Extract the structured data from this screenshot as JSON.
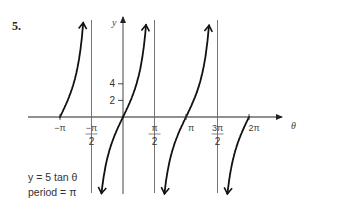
{
  "problem_number": "5.",
  "chart_data": {
    "type": "line",
    "title": "",
    "function": "y = 5 tan θ",
    "series": [
      {
        "name": "y = 5 tan θ",
        "branch": 1,
        "x_domain": [
          "-π",
          "-π/2"
        ],
        "x": [
          -3.1416,
          -2.8,
          -2.4,
          -2.0,
          -1.75,
          -1.65
        ],
        "y": [
          0,
          1.72,
          4.58,
          10.93,
          27.3,
          64.0
        ]
      },
      {
        "name": "y = 5 tan θ",
        "branch": 2,
        "x_domain": [
          "-π/2",
          "π/2"
        ],
        "x": [
          -1.48,
          -1.2,
          -0.8,
          -0.4,
          0,
          0.4,
          0.8,
          1.2,
          1.48
        ],
        "y": [
          -54.4,
          -12.86,
          -5.15,
          -2.11,
          0,
          2.11,
          5.15,
          12.86,
          54.4
        ]
      },
      {
        "name": "y = 5 tan θ",
        "branch": 3,
        "x_domain": [
          "π/2",
          "3π/2"
        ],
        "x": [
          1.66,
          2.0,
          2.6,
          3.1416,
          3.6,
          4.2,
          4.62
        ],
        "y": [
          -54.4,
          -10.93,
          -3.01,
          0,
          2.46,
          8.9,
          54.4
        ]
      },
      {
        "name": "y = 5 tan θ",
        "branch": 4,
        "x_domain": [
          "3π/2",
          "2π"
        ],
        "x": [
          4.8,
          5.1,
          5.6,
          6.2832
        ],
        "y": [
          -54.4,
          -12.3,
          -3.78,
          0
        ]
      }
    ],
    "asymptotes": [
      {
        "x": -1.5708,
        "label_num": "−π",
        "label_den": "2"
      },
      {
        "x": 1.5708,
        "label_num": "π",
        "label_den": "2"
      },
      {
        "x": 4.7124,
        "label_num": "3π",
        "label_den": "2"
      }
    ],
    "x_ticks": [
      {
        "value": -3.1416,
        "label": "−π"
      },
      {
        "value": 3.1416,
        "label": "π"
      },
      {
        "value": 6.2832,
        "label": "2π"
      }
    ],
    "y_ticks": [
      {
        "value": 2,
        "label": "2"
      },
      {
        "value": 4,
        "label": "4"
      }
    ],
    "xlabel": "θ",
    "ylabel": "y",
    "annotations": [
      "y = 5 tan θ",
      "period = π"
    ],
    "grid": false,
    "legend": "none"
  }
}
